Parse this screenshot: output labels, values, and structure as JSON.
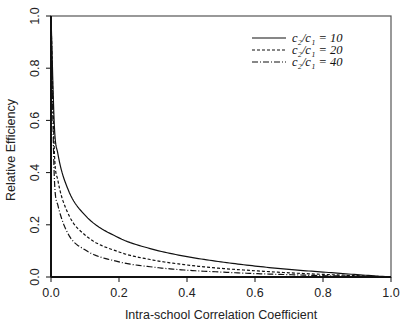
{
  "chart_data": {
    "type": "line",
    "title": "",
    "xlabel": "Intra-school Correlation Coefficient",
    "ylabel": "Relative Efficiency",
    "xlim": [
      0.0,
      1.0
    ],
    "ylim": [
      0.0,
      1.0
    ],
    "xticks": [
      "0.0",
      "0.2",
      "0.4",
      "0.6",
      "0.8",
      "1.0"
    ],
    "yticks": [
      "0.0",
      "0.2",
      "0.4",
      "0.6",
      "0.8",
      "1.0"
    ],
    "grid": false,
    "legend_position": "upper right",
    "x": [
      0.0,
      0.01,
      0.02,
      0.05,
      0.1,
      0.2,
      0.3,
      0.4,
      0.5,
      0.6,
      0.7,
      0.8,
      0.9,
      1.0
    ],
    "series": [
      {
        "name": "c2/c1 = 10",
        "label_main": "c",
        "ratio": "10",
        "line_style": "solid",
        "values": [
          1.0,
          0.576,
          0.474,
          0.336,
          0.237,
          0.15,
          0.106,
          0.078,
          0.058,
          0.042,
          0.029,
          0.019,
          0.009,
          0.0
        ]
      },
      {
        "name": "c2/c1 = 20",
        "label_main": "c",
        "ratio": "20",
        "line_style": "dashed",
        "values": [
          1.0,
          0.476,
          0.372,
          0.244,
          0.161,
          0.096,
          0.065,
          0.046,
          0.033,
          0.024,
          0.016,
          0.01,
          0.005,
          0.0
        ]
      },
      {
        "name": "c2/c1 = 40",
        "label_main": "c",
        "ratio": "40",
        "line_style": "dashdot",
        "values": [
          1.0,
          0.374,
          0.276,
          0.166,
          0.104,
          0.058,
          0.038,
          0.026,
          0.019,
          0.013,
          0.009,
          0.005,
          0.003,
          0.0
        ]
      }
    ]
  },
  "legend": {
    "items": [
      {
        "lhs": "c₂/c₁ = 10"
      },
      {
        "lhs": "c₂/c₁ = 20"
      },
      {
        "lhs": "c₂/c₁ = 40"
      }
    ]
  },
  "colors": {
    "line": "#111111",
    "axis": "#222222",
    "frame": "#555555"
  }
}
